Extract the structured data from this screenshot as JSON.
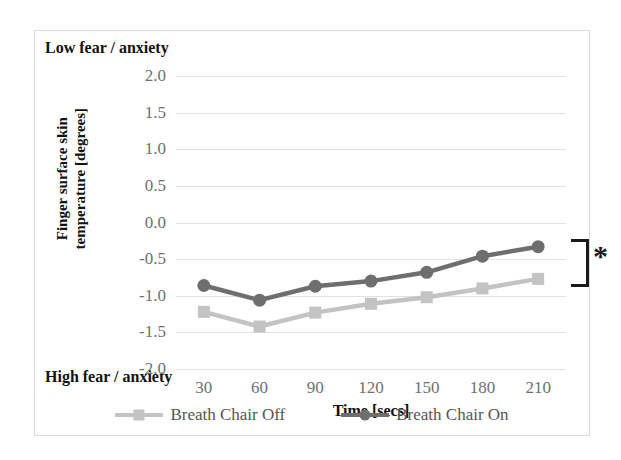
{
  "figure": {
    "low_annotation": "Low fear / anxiety",
    "high_annotation": "High fear / anxiety",
    "significance_marker": "*"
  },
  "colors": {
    "series_off": "#c3c3c3",
    "series_on": "#6e6e6e",
    "gridline": "#e2e2e2",
    "tick_text": "#6f6f6f",
    "axis_title_text": "#111111",
    "frame_border": "#d9d9d9",
    "significance": "#1a1a1a"
  },
  "chart_data": {
    "type": "line",
    "title": "",
    "xlabel": "Time [secs]",
    "ylabel": "Finger surface skin temperature [degrees]",
    "ylabel_line1": "Finger surface skin",
    "ylabel_line2": "temperature [degrees]",
    "x": [
      30,
      60,
      90,
      120,
      150,
      180,
      210
    ],
    "categories": [
      "30",
      "60",
      "90",
      "120",
      "150",
      "180",
      "210"
    ],
    "ylim": [
      -2.0,
      2.0
    ],
    "yticks": [
      2.0,
      1.5,
      1.0,
      0.5,
      0.0,
      -0.5,
      -1.0,
      -1.5,
      -2.0
    ],
    "ytick_labels": [
      "2.0",
      "1.5",
      "1.0",
      "0.5",
      "0.0",
      "-0.5",
      "-1.0",
      "-1.5",
      "-2.0"
    ],
    "grid": true,
    "legend_position": "bottom",
    "series": [
      {
        "name": "Breath Chair Off",
        "marker": "square",
        "color": "#c3c3c3",
        "values": [
          -1.22,
          -1.42,
          -1.23,
          -1.11,
          -1.02,
          -0.9,
          -0.77
        ]
      },
      {
        "name": "Breath Chair On",
        "marker": "circle",
        "color": "#6e6e6e",
        "values": [
          -0.86,
          -1.06,
          -0.87,
          -0.8,
          -0.68,
          -0.46,
          -0.33
        ]
      }
    ],
    "annotations": [
      {
        "text": "Low fear / anxiety",
        "position": "top-left"
      },
      {
        "text": "High fear / anxiety",
        "position": "bottom-left"
      },
      {
        "text": "*",
        "position": "right",
        "meaning": "significance-bracket"
      }
    ]
  }
}
